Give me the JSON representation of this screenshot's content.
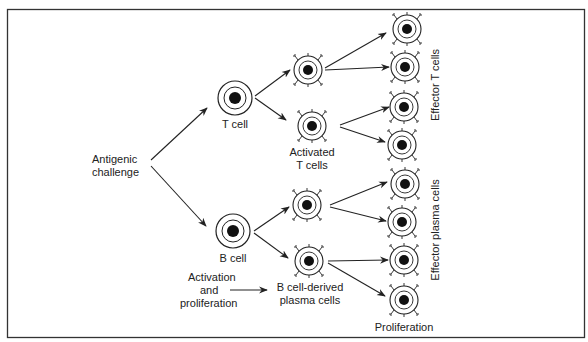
{
  "diagram": {
    "labels": {
      "antigenic_line1": "Antigenic",
      "antigenic_line2": "challenge",
      "t_cell": "T cell",
      "b_cell": "B cell",
      "activated_line1": "Activated",
      "activated_line2": "T cells",
      "activation_line1": "Activation",
      "activation_line2": "and",
      "activation_line3": "proliferation",
      "bderived_line1": "B cell-derived",
      "bderived_line2": "plasma cells",
      "proliferation": "Proliferation",
      "effector_t": "Effector T cells",
      "effector_plasma": "Effector plasma cells"
    },
    "colors": {
      "stroke": "#222222",
      "nucleus": "#111111",
      "background": "#ffffff"
    }
  }
}
